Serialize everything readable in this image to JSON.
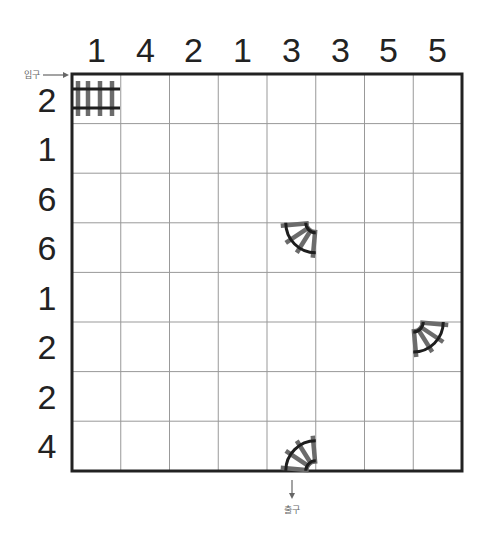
{
  "puzzle": {
    "type": "train-tracks",
    "grid": {
      "rows": 8,
      "cols": 8,
      "left": 72,
      "top": 74,
      "cell_w": 48.75,
      "cell_h": 49.6
    },
    "column_clues": [
      1,
      4,
      2,
      1,
      3,
      3,
      5,
      5
    ],
    "row_clues": [
      2,
      1,
      6,
      6,
      1,
      2,
      2,
      4
    ],
    "entrance": {
      "label": "입구",
      "row": 1,
      "side": "left"
    },
    "exit": {
      "label": "출구",
      "col": 5,
      "side": "bottom"
    },
    "given_tracks": [
      {
        "row": 1,
        "col": 1,
        "piece": "straight-horizontal"
      },
      {
        "row": 4,
        "col": 5,
        "piece": "curve-top-right"
      },
      {
        "row": 6,
        "col": 8,
        "piece": "curve-top-left"
      },
      {
        "row": 8,
        "col": 5,
        "piece": "curve-bottom-right"
      }
    ],
    "colors": {
      "grid_line": "#999999",
      "border": "#222222",
      "rail": "#1e1e1e",
      "tie": "#6b6b6b",
      "text": "#222222"
    }
  }
}
